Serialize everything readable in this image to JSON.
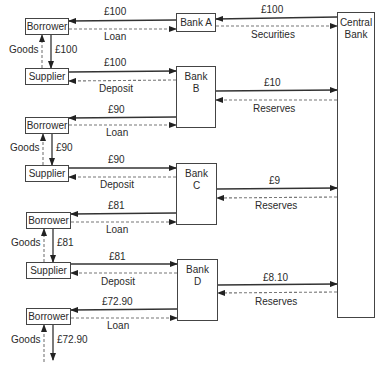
{
  "diagram": {
    "nodes": {
      "borrower_1": "Borrower",
      "supplier_1": "Supplier",
      "borrower_2": "Borrower",
      "supplier_2": "Supplier",
      "borrower_3": "Borrower",
      "supplier_3": "Supplier",
      "borrower_4": "Borrower",
      "bank_a": "Bank A",
      "bank_b_line1": "Bank",
      "bank_b_line2": "B",
      "bank_c_line1": "Bank",
      "bank_c_line2": "C",
      "bank_d_line1": "Bank",
      "bank_d_line2": "D",
      "central_bank_line1": "Central",
      "central_bank_line2": "Bank"
    },
    "flows": {
      "cb_to_bank_a_amount": "£100",
      "bank_a_to_cb_label": "Securities",
      "bank_a_to_borrower_1_amount": "£100",
      "borrower_1_loan_label": "Loan",
      "borrower_1_to_supplier_1_amount": "£100",
      "goods_1": "Goods",
      "supplier_1_to_bank_b_amount": "£100",
      "deposit_1": "Deposit",
      "bank_b_to_cb_amount": "£10",
      "reserves_b": "Reserves",
      "bank_b_to_borrower_2_amount": "£90",
      "borrower_2_loan_label": "Loan",
      "borrower_2_to_supplier_2_amount": "£90",
      "goods_2": "Goods",
      "supplier_2_to_bank_c_amount": "£90",
      "deposit_2": "Deposit",
      "bank_c_to_cb_amount": "£9",
      "reserves_c": "Reserves",
      "bank_c_to_borrower_3_amount": "£81",
      "borrower_3_loan_label": "Loan",
      "borrower_3_to_supplier_3_amount": "£81",
      "goods_3": "Goods",
      "supplier_3_to_bank_d_amount": "£81",
      "deposit_3": "Deposit",
      "bank_d_to_cb_amount": "£8.10",
      "reserves_d": "Reserves",
      "bank_d_to_borrower_4_amount": "£72.90",
      "borrower_4_loan_label": "Loan",
      "borrower_4_onward_amount": "£72.90",
      "goods_4": "Goods"
    },
    "colors": {
      "line": "#333333",
      "dashed": "#777777",
      "text": "#2a2a2a"
    }
  }
}
